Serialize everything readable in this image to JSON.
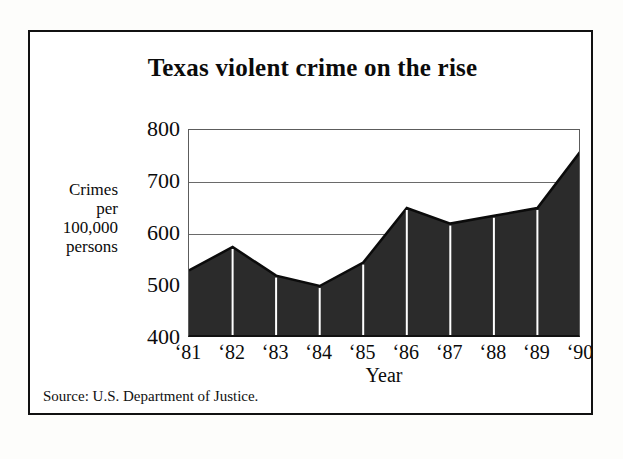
{
  "figure": {
    "title": "Texas violent crime on the rise",
    "source_note": "Source:  U.S. Department of Justice.",
    "frame_color": "#111111",
    "background_color": "#ffffff"
  },
  "axis": {
    "y_label_lines": [
      "Crimes",
      "per",
      "100,000",
      "persons"
    ],
    "x_title": "Year",
    "y_ticks": [
      "800",
      "700",
      "600",
      "500",
      "400"
    ],
    "x_ticks": [
      "‘81",
      "‘82",
      "‘83",
      "‘84",
      "‘85",
      "‘86",
      "‘87",
      "‘88",
      "‘89",
      "‘90"
    ]
  },
  "chart_data": {
    "type": "area",
    "title": "Texas violent crime on the rise",
    "subtitle": "",
    "xlabel": "Year",
    "ylabel": "Crimes per 100,000 persons",
    "categories": [
      "'81",
      "'82",
      "'83",
      "'84",
      "'85",
      "'86",
      "'87",
      "'88",
      "'89",
      "'90"
    ],
    "x_tick_labels": [
      "‘81",
      "‘82",
      "‘83",
      "‘84",
      "‘85",
      "‘86",
      "‘87",
      "‘88",
      "‘89",
      "‘90"
    ],
    "values": [
      530,
      575,
      520,
      500,
      545,
      650,
      620,
      635,
      650,
      760
    ],
    "ylim": [
      400,
      800
    ],
    "y_ticks": [
      400,
      500,
      600,
      700,
      800
    ],
    "grid": "horizontal",
    "legend": "none",
    "fill_color": "#2b2b2b",
    "line_color": "#0b0b0b",
    "separator_color": "#ffffff",
    "annotations": [],
    "source": "U.S. Department of Justice"
  }
}
